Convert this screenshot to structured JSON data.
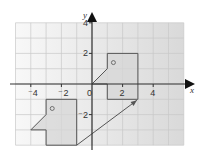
{
  "diagram": {
    "type": "coordinate-grid-translation",
    "axes": {
      "x_label": "x",
      "y_label": "y",
      "x_ticks": [
        {
          "value": -4,
          "label": "⁻4"
        },
        {
          "value": -2,
          "label": "⁻2"
        },
        {
          "value": 0,
          "label": "0"
        },
        {
          "value": 2,
          "label": "2"
        },
        {
          "value": 4,
          "label": "4"
        }
      ],
      "y_ticks": [
        {
          "value": 4,
          "label": "4"
        },
        {
          "value": 2,
          "label": "2"
        },
        {
          "value": -2,
          "label": "⁻2"
        }
      ],
      "grid_x_range": [
        -5,
        6
      ],
      "grid_y_range": [
        -4,
        4
      ]
    },
    "original_shape": {
      "name": "shape-A",
      "vertices": [
        [
          -4,
          -3
        ],
        [
          -3,
          -2
        ],
        [
          -3,
          -1
        ],
        [
          -1,
          -1
        ],
        [
          -1,
          -4
        ],
        [
          -3,
          -4
        ],
        [
          -3,
          -3
        ]
      ],
      "marker": [
        -2.6,
        -1.6
      ]
    },
    "translated_shape": {
      "name": "shape-B",
      "vertices": [
        [
          0,
          0
        ],
        [
          1,
          1
        ],
        [
          1,
          2
        ],
        [
          3,
          2
        ],
        [
          3,
          -1
        ],
        [
          1,
          -1
        ],
        [
          1,
          0
        ]
      ],
      "marker": [
        1.4,
        1.4
      ]
    },
    "translation_arrow": {
      "from": [
        -1,
        -4
      ],
      "to": [
        3,
        -1
      ]
    },
    "colors": {
      "grid_line": "#c8c8c8",
      "axis": "#333333",
      "shape_fill": "#d6d6d6",
      "shape_stroke": "#555555",
      "grid_bg_left": "#f8f8f8",
      "grid_bg_right": "#d9d9d9"
    }
  }
}
